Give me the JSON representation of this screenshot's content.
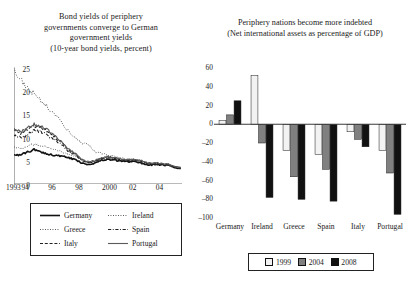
{
  "left": {
    "title_lines": [
      "Bond yields of periphery",
      "governments converge to German",
      "government yields",
      "(10-year bond yields, percent)"
    ],
    "legend": [
      {
        "label": "Germany",
        "style": "solid-thick",
        "color": "#222222"
      },
      {
        "label": "Ireland",
        "style": "dotted",
        "color": "#555555"
      },
      {
        "label": "Greece",
        "style": "dotted",
        "color": "#555555"
      },
      {
        "label": "Spain",
        "style": "dash-dot",
        "color": "#222222"
      },
      {
        "label": "Italy",
        "style": "dashed",
        "color": "#222222"
      },
      {
        "label": "Portugal",
        "style": "solid-thin",
        "color": "#444444"
      }
    ]
  },
  "right": {
    "title_lines": [
      "Periphery nations become more indebted",
      "(Net international assets as percentage of GDP)"
    ],
    "legend": [
      {
        "label": "1999",
        "color": "#f2f2f2"
      },
      {
        "label": "2004",
        "color": "#808080"
      },
      {
        "label": "2008",
        "color": "#111111"
      }
    ]
  },
  "chart_data": [
    {
      "type": "line",
      "title": "Bond yields of periphery governments converge to German government yields",
      "subtitle": "(10-year bond yields, percent)",
      "xlabel": "",
      "ylabel": "",
      "ylim": [
        0,
        25
      ],
      "yticks": [
        0,
        5,
        10,
        15,
        20,
        25
      ],
      "xlim": [
        1993,
        2005.5
      ],
      "xticks": [
        1993,
        1994,
        1996,
        1998,
        2000,
        2002,
        2004
      ],
      "xticklabels": [
        "1993",
        "94",
        "96",
        "98",
        "2000",
        "02",
        "04"
      ],
      "grid": false,
      "legend_position": "below-plot",
      "x": [
        1993.0,
        1993.5,
        1994.0,
        1994.5,
        1995.0,
        1995.5,
        1996.0,
        1996.5,
        1997.0,
        1997.5,
        1998.0,
        1998.5,
        1999.0,
        1999.5,
        2000.0,
        2000.5,
        2001.0,
        2001.5,
        2002.0,
        2002.5,
        2003.0,
        2003.5,
        2004.0,
        2004.5,
        2005.0,
        2005.4
      ],
      "series": [
        {
          "name": "Germany",
          "style": "solid-thick",
          "values": [
            6.4,
            6.2,
            6.9,
            7.4,
            6.9,
            6.5,
            6.2,
            6.0,
            5.7,
            5.3,
            4.6,
            4.2,
            4.5,
            5.1,
            5.3,
            5.1,
            4.9,
            4.8,
            4.9,
            4.5,
            4.1,
            4.2,
            4.1,
            4.0,
            3.5,
            3.3
          ]
        },
        {
          "name": "Ireland",
          "style": "dotted",
          "values": [
            8.0,
            7.6,
            8.2,
            8.5,
            8.3,
            7.9,
            7.5,
            7.0,
            6.4,
            6.1,
            5.2,
            4.6,
            4.8,
            5.4,
            5.6,
            5.4,
            5.1,
            5.0,
            5.1,
            4.7,
            4.3,
            4.3,
            4.2,
            4.1,
            3.6,
            3.4
          ]
        },
        {
          "name": "Greece",
          "style": "dotted",
          "values": [
            24.5,
            22.5,
            20.5,
            19.5,
            18.0,
            16.5,
            15.0,
            13.5,
            11.5,
            10.0,
            9.0,
            8.5,
            7.0,
            6.6,
            6.2,
            6.0,
            5.5,
            5.4,
            5.3,
            4.9,
            4.4,
            4.4,
            4.3,
            4.2,
            3.7,
            3.5
          ]
        },
        {
          "name": "Spain",
          "style": "dash-dot",
          "values": [
            10.5,
            10.0,
            10.6,
            11.5,
            11.3,
            10.5,
            9.6,
            8.6,
            7.2,
            6.4,
            5.2,
            4.6,
            4.8,
            5.5,
            5.7,
            5.5,
            5.2,
            5.1,
            5.1,
            4.8,
            4.4,
            4.4,
            4.2,
            4.1,
            3.6,
            3.4
          ]
        },
        {
          "name": "Italy",
          "style": "dashed",
          "values": [
            11.5,
            11.0,
            11.8,
            12.6,
            12.2,
            11.4,
            10.2,
            9.0,
            7.5,
            6.6,
            5.3,
            4.7,
            4.9,
            5.6,
            5.8,
            5.6,
            5.3,
            5.2,
            5.2,
            4.9,
            4.5,
            4.5,
            4.3,
            4.2,
            3.7,
            3.5
          ]
        },
        {
          "name": "Portugal",
          "style": "solid-thin",
          "values": [
            11.8,
            11.2,
            12.0,
            12.8,
            12.4,
            11.6,
            10.4,
            9.2,
            7.6,
            6.7,
            5.4,
            4.8,
            5.0,
            5.7,
            5.9,
            5.7,
            5.4,
            5.3,
            5.3,
            5.0,
            4.6,
            4.6,
            4.4,
            4.3,
            3.8,
            3.6
          ]
        }
      ]
    },
    {
      "type": "bar",
      "title": "Periphery nations become more indebted",
      "subtitle": "(Net international assets as percentage of GDP)",
      "xlabel": "",
      "ylabel": "",
      "ylim": [
        -100,
        60
      ],
      "yticks": [
        60,
        40,
        20,
        0,
        -20,
        -40,
        -60,
        -80,
        -100
      ],
      "grid": false,
      "legend_position": "below-plot",
      "categories": [
        "Germany",
        "Ireland",
        "Greece",
        "Spain",
        "Italy",
        "Portugal"
      ],
      "series": [
        {
          "name": "1999",
          "values": [
            4,
            52,
            -28,
            -32,
            -8,
            -28
          ]
        },
        {
          "name": "2004",
          "values": [
            10,
            -20,
            -56,
            -48,
            -16,
            -52
          ]
        },
        {
          "name": "2008",
          "values": [
            25,
            -78,
            -80,
            -82,
            -24,
            -96
          ]
        }
      ]
    }
  ]
}
